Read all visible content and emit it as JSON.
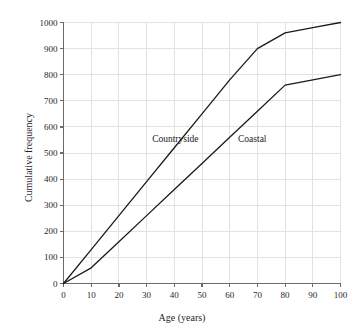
{
  "chart_data": {
    "type": "line",
    "title": "",
    "xlabel": "Age (years)",
    "ylabel": "Cumulative frequency",
    "xlim": [
      0,
      100
    ],
    "ylim": [
      0,
      1000
    ],
    "xticks": [
      0,
      10,
      20,
      30,
      40,
      50,
      60,
      70,
      80,
      90,
      100
    ],
    "yticks": [
      0,
      100,
      200,
      300,
      400,
      500,
      600,
      700,
      800,
      900,
      1000
    ],
    "grid": true,
    "legend_position": "inline-labels",
    "series": [
      {
        "name": "Countryside",
        "x": [
          0,
          10,
          20,
          30,
          40,
          50,
          60,
          70,
          80,
          90,
          100
        ],
        "values": [
          0,
          130,
          260,
          390,
          520,
          650,
          780,
          900,
          960,
          980,
          1000
        ],
        "color": "#1a1a1a",
        "label_x": 32,
        "label_y": 555
      },
      {
        "name": "Coastal",
        "x": [
          0,
          10,
          20,
          30,
          40,
          50,
          60,
          70,
          80,
          90,
          100
        ],
        "values": [
          0,
          60,
          160,
          260,
          360,
          460,
          560,
          660,
          760,
          780,
          800
        ],
        "color": "#1a1a1a",
        "label_x": 63,
        "label_y": 555
      }
    ]
  },
  "axes": {
    "x_tick_labels": [
      "0",
      "10",
      "20",
      "30",
      "40",
      "50",
      "60",
      "70",
      "80",
      "90",
      "100"
    ],
    "y_tick_labels": [
      "0",
      "100",
      "200",
      "300",
      "400",
      "500",
      "600",
      "700",
      "800",
      "900",
      "1000"
    ],
    "x_title": "Age (years)",
    "y_title": "Cumulative frequency"
  },
  "style": {
    "grid_color": "#e2e2e2",
    "axis_color": "#6b6b6b",
    "curve_color": "#1a1a1a",
    "background": "#ffffff"
  }
}
